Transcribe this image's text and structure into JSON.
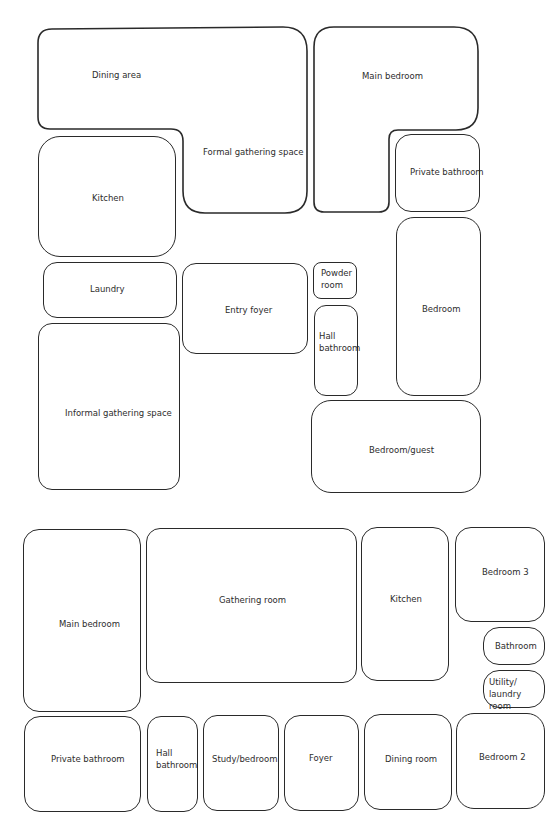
{
  "plans": [
    {
      "name": "plan-1",
      "rooms": [
        {
          "id": "dining-area",
          "label": "Dining area",
          "shape": "L-part"
        },
        {
          "id": "formal-gathering-space",
          "label": "Formal gathering space",
          "shape": "L-part"
        },
        {
          "id": "main-bedroom",
          "label": "Main bedroom",
          "shape": "L"
        },
        {
          "id": "private-bathroom",
          "label": "Private bathroom"
        },
        {
          "id": "kitchen",
          "label": "Kitchen"
        },
        {
          "id": "laundry",
          "label": "Laundry"
        },
        {
          "id": "entry-foyer",
          "label": "Entry foyer"
        },
        {
          "id": "powder-room",
          "label": "Powder\nroom"
        },
        {
          "id": "hall-bathroom",
          "label": "Hall\nbathroom"
        },
        {
          "id": "bedroom",
          "label": "Bedroom"
        },
        {
          "id": "informal-gathering-space",
          "label": "Informal gathering space"
        },
        {
          "id": "bedroom-guest",
          "label": "Bedroom/guest"
        }
      ]
    },
    {
      "name": "plan-2",
      "rooms": [
        {
          "id": "main-bedroom",
          "label": "Main bedroom"
        },
        {
          "id": "gathering-room",
          "label": "Gathering room"
        },
        {
          "id": "kitchen",
          "label": "Kitchen"
        },
        {
          "id": "bedroom-3",
          "label": "Bedroom 3"
        },
        {
          "id": "bathroom",
          "label": "Bathroom"
        },
        {
          "id": "utility-laundry-room",
          "label": "Utility/\nlaundry room"
        },
        {
          "id": "private-bathroom",
          "label": "Private bathroom"
        },
        {
          "id": "hall-bathroom",
          "label": "Hall\nbathroom"
        },
        {
          "id": "study-bedroom",
          "label": "Study/bedroom"
        },
        {
          "id": "foyer",
          "label": "Foyer"
        },
        {
          "id": "dining-room",
          "label": "Dining room"
        },
        {
          "id": "bedroom-2",
          "label": "Bedroom 2"
        }
      ]
    }
  ],
  "colors": {
    "stroke": "#2a2a2a",
    "text": "#2d2d2d",
    "background": "#ffffff"
  }
}
